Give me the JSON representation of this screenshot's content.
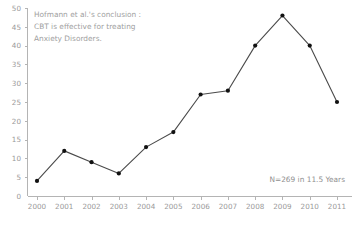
{
  "chart_data": {
    "type": "line",
    "title": "",
    "xlabel": "",
    "ylabel": "",
    "categories": [
      "2000",
      "2001",
      "2002",
      "2003",
      "2004",
      "2005",
      "2006",
      "2007",
      "2008",
      "2009",
      "2010",
      "2011"
    ],
    "values": [
      4,
      12,
      9,
      6,
      13,
      17,
      27,
      28,
      40,
      48,
      40,
      25
    ],
    "series": [
      {
        "name": "Publications",
        "values": [
          4,
          12,
          9,
          6,
          13,
          17,
          27,
          28,
          40,
          48,
          40,
          25
        ]
      }
    ],
    "ylim": [
      0,
      50
    ],
    "y_ticks": [
      0,
      5,
      10,
      15,
      20,
      25,
      30,
      35,
      40,
      45,
      50
    ],
    "x_ticks": [
      "2000",
      "2001",
      "2002",
      "2003",
      "2004",
      "2005",
      "2006",
      "2007",
      "2008",
      "2009",
      "2010",
      "2011"
    ],
    "grid": false,
    "legend": "none",
    "annotations": [
      {
        "name": "conclusion-note",
        "lines": [
          "Hofmann et al.'s conclusion :",
          "CBT is effective for treating",
          "Anxiety Disorders."
        ],
        "position": "top-left"
      },
      {
        "name": "sample-size-note",
        "text": "N=269 in 11.5 Years",
        "position": "bottom-right"
      }
    ],
    "colors": {
      "line": "#4a4a4a",
      "marker": "#111111",
      "axis": "#b4b4b4",
      "tick_label": "#9a9a9a",
      "annotation": "#a0a0a0",
      "note": "#8f8f8f",
      "background": "#ffffff"
    }
  },
  "annotation_lines": {
    "line1": "Hofmann et al.'s conclusion :",
    "line2": "CBT is effective for treating",
    "line3": "Anxiety Disorders."
  },
  "sample_note": {
    "text": "N=269 in 11.5 Years"
  }
}
